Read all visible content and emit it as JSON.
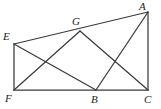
{
  "figure": {
    "type": "geometry-diagram",
    "width": 161,
    "height": 109,
    "background_color": "#ffffff",
    "stroke_color": "#3a3a3f",
    "label_color": "#1c1c20",
    "points": {
      "A": {
        "label": "A",
        "x": 148,
        "y": 12,
        "label_x": 139,
        "label_y": 1
      },
      "E": {
        "label": "E",
        "x": 14,
        "y": 44,
        "label_x": 3,
        "label_y": 31
      },
      "G": {
        "label": "G",
        "x": 80,
        "y": 31,
        "label_x": 72,
        "label_y": 16
      },
      "F": {
        "label": "F",
        "x": 14,
        "y": 90,
        "label_x": 5,
        "label_y": 93
      },
      "B": {
        "label": "B",
        "x": 96,
        "y": 90,
        "label_x": 91,
        "label_y": 94
      },
      "C": {
        "label": "C",
        "x": 148,
        "y": 90,
        "label_x": 144,
        "label_y": 94
      }
    },
    "segments": [
      {
        "name": "segment-E-A",
        "from": "E",
        "to": "A"
      },
      {
        "name": "segment-F-C",
        "from": "F",
        "to": "C"
      },
      {
        "name": "segment-E-F",
        "from": "E",
        "to": "F"
      },
      {
        "name": "segment-A-C",
        "from": "A",
        "to": "C"
      },
      {
        "name": "segment-E-B",
        "from": "E",
        "to": "B"
      },
      {
        "name": "segment-F-G",
        "from": "F",
        "to": "G"
      },
      {
        "name": "segment-G-C",
        "from": "G",
        "to": "C"
      },
      {
        "name": "segment-B-A",
        "from": "B",
        "to": "A"
      }
    ]
  }
}
